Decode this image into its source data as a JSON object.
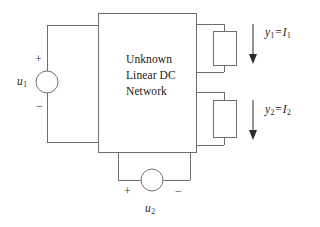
{
  "figure": {
    "background_color": "#ffffff",
    "line_color": "#6e6e6e",
    "text_color": "#1a1a1a",
    "arrow_color": "#2b2b2b"
  },
  "network_box": {
    "label_line_1": "Unknown",
    "label_line_2": "Linear DC",
    "label_line_3": "Network"
  },
  "sources": {
    "left": {
      "name": "u",
      "subscript": "1",
      "plus_sign": "+",
      "minus_sign": "−"
    },
    "bottom": {
      "name": "u",
      "subscript": "2",
      "plus_sign": "+",
      "minus_sign": "−"
    }
  },
  "outputs": [
    {
      "output_name": "y",
      "output_subscript": "1",
      "equals": "=",
      "current_name": "I",
      "current_subscript": "1",
      "arrow_direction": "down"
    },
    {
      "output_name": "y",
      "output_subscript": "2",
      "equals": "=",
      "current_name": "I",
      "current_subscript": "2",
      "arrow_direction": "down"
    }
  ]
}
